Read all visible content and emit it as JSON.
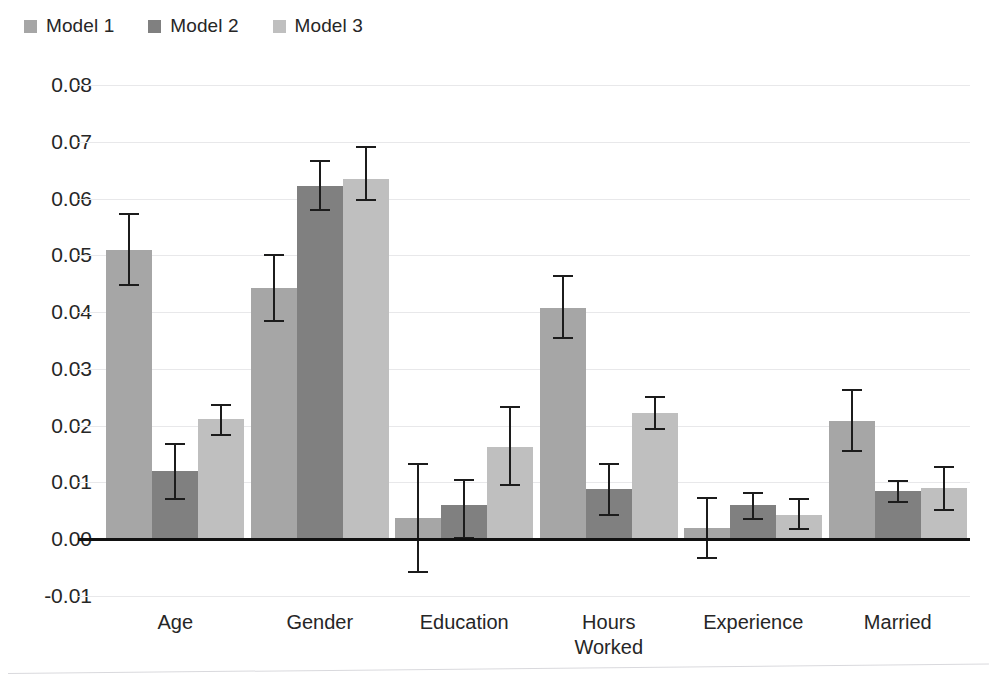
{
  "chart_data": {
    "type": "bar",
    "title": "",
    "xlabel": "",
    "ylabel": "",
    "ylim": [
      -0.01,
      0.08
    ],
    "ytick_labels": [
      "0.08",
      "0.07",
      "0.06",
      "0.05",
      "0.04",
      "0.03",
      "0.02",
      "0.01",
      "0.00",
      "-0.01"
    ],
    "ytick_values": [
      0.08,
      0.07,
      0.06,
      0.05,
      0.04,
      0.03,
      0.02,
      0.01,
      0.0,
      -0.01
    ],
    "grid": true,
    "legend_position": "top-left",
    "categories": [
      "Age",
      "Gender",
      "Education",
      "Hours\nWorked",
      "Experience",
      "Married"
    ],
    "series": [
      {
        "name": "Model 1",
        "color": "#a6a6a6",
        "values": [
          0.051,
          0.0442,
          0.0038,
          0.0408,
          0.002,
          0.0208
        ],
        "err_upper": [
          0.0572,
          0.0501,
          0.0132,
          0.0463,
          0.0073,
          0.0263
        ],
        "err_lower": [
          0.0447,
          0.0385,
          -0.0057,
          0.0355,
          -0.0033,
          0.0155
        ]
      },
      {
        "name": "Model 2",
        "color": "#808080",
        "values": [
          0.012,
          0.0622,
          0.0061,
          0.0088,
          0.006,
          0.0085
        ],
        "err_upper": [
          0.0168,
          0.0666,
          0.0104,
          0.0133,
          0.0081,
          0.0103
        ],
        "err_lower": [
          0.0071,
          0.058,
          0.0002,
          0.0042,
          0.0035,
          0.0066
        ]
      },
      {
        "name": "Model 3",
        "color": "#bfbfbf",
        "values": [
          0.0211,
          0.0635,
          0.0163,
          0.0222,
          0.0043,
          0.009
        ],
        "err_upper": [
          0.0237,
          0.069,
          0.0232,
          0.025,
          0.007,
          0.0128
        ],
        "err_lower": [
          0.0184,
          0.0597,
          0.0096,
          0.0194,
          0.0018,
          0.0052
        ]
      }
    ]
  },
  "legend": {
    "items": [
      {
        "label": "Model 1",
        "color": "#a6a6a6"
      },
      {
        "label": "Model 2",
        "color": "#808080"
      },
      {
        "label": "Model 3",
        "color": "#bfbfbf"
      }
    ]
  }
}
